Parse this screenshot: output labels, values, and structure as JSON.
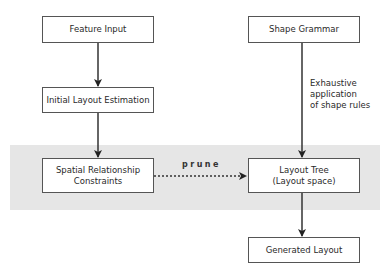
{
  "diagram": {
    "nodes": {
      "feature_input": "Feature Input",
      "initial_layout": "Initial Layout Estimation",
      "spatial_line1": "Spatial Relationship",
      "spatial_line2": "Constraints",
      "shape_grammar": "Shape Grammar",
      "layout_tree_line1": "Layout Tree",
      "layout_tree_line2": "(Layout space)",
      "generated_layout": "Generated Layout"
    },
    "edge_labels": {
      "exhaustive_line1": "Exhaustive",
      "exhaustive_line2": "application",
      "exhaustive_line3": "of shape rules",
      "prune": "prune"
    },
    "colors": {
      "band": "#e6e6e6",
      "stroke": "#333333"
    }
  }
}
